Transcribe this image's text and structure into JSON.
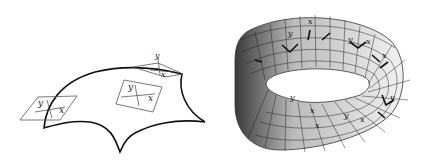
{
  "figure": {
    "left_panel": {
      "description": "curved surface with tangent planes",
      "tangent_planes": [
        {
          "x_label": "x",
          "y_label": "y"
        },
        {
          "x_label": "x",
          "y_label": "y"
        },
        {
          "x_label": "x",
          "y_label": "y"
        }
      ],
      "stroke_color": "#111111"
    },
    "right_panel": {
      "description": "mobius strip with local coordinate frames",
      "frame_labels": [
        "x",
        "y",
        "x",
        "y",
        "x",
        "y",
        "x",
        "y",
        "x",
        "y",
        "x"
      ],
      "shade_dark": "#3a3a3a",
      "shade_light": "#f2f2f2"
    }
  }
}
